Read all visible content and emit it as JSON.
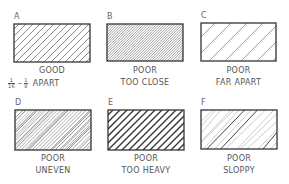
{
  "figure": {
    "panels": [
      {
        "id": "A",
        "letter": "A",
        "rating": "GOOD",
        "note": "APART",
        "fraction_low": {
          "num": "1",
          "den": "16"
        },
        "fraction_high": {
          "num": "1",
          "den": "8"
        },
        "dash": "–",
        "hatch": {
          "spacing": 7,
          "stroke": 0.7,
          "color": "#555555",
          "variant": "even"
        },
        "box": {
          "x": 14,
          "y": 24,
          "w": 76,
          "h": 38
        },
        "letter_pos": {
          "x": 14,
          "y": 13
        },
        "cap1_y": 66,
        "cap2_y": 78
      },
      {
        "id": "B",
        "letter": "B",
        "rating": "POOR",
        "note": "TOO CLOSE",
        "hatch": {
          "spacing": 2.6,
          "stroke": 0.6,
          "color": "#666666",
          "variant": "even"
        },
        "box": {
          "x": 107,
          "y": 24,
          "w": 76,
          "h": 37
        },
        "letter_pos": {
          "x": 107,
          "y": 13
        },
        "cap1_y": 66,
        "cap2_y": 78
      },
      {
        "id": "C",
        "letter": "C",
        "rating": "POOR",
        "note": "FAR APART",
        "hatch": {
          "spacing": 16,
          "stroke": 0.7,
          "color": "#777777",
          "variant": "even"
        },
        "box": {
          "x": 201,
          "y": 23,
          "w": 75,
          "h": 38
        },
        "letter_pos": {
          "x": 201,
          "y": 12
        },
        "cap1_y": 66,
        "cap2_y": 78
      },
      {
        "id": "D",
        "letter": "D",
        "rating": "POOR",
        "note": "UNEVEN",
        "hatch": {
          "spacing": 3,
          "stroke": 0.6,
          "color": "#666666",
          "variant": "uneven"
        },
        "box": {
          "x": 15,
          "y": 110,
          "w": 76,
          "h": 40
        },
        "letter_pos": {
          "x": 15,
          "y": 99
        },
        "cap1_y": 154,
        "cap2_y": 166
      },
      {
        "id": "E",
        "letter": "E",
        "rating": "POOR",
        "note": "TOO HEAVY",
        "hatch": {
          "spacing": 7,
          "stroke": 1.3,
          "color": "#333333",
          "variant": "even"
        },
        "box": {
          "x": 108,
          "y": 110,
          "w": 76,
          "h": 40
        },
        "letter_pos": {
          "x": 108,
          "y": 99
        },
        "cap1_y": 154,
        "cap2_y": 166
      },
      {
        "id": "F",
        "letter": "F",
        "rating": "POOR",
        "note": "SLOPPY",
        "hatch": {
          "spacing": 6,
          "stroke": 0.7,
          "color": "#999999",
          "variant": "sloppy"
        },
        "box": {
          "x": 201,
          "y": 110,
          "w": 76,
          "h": 39
        },
        "letter_pos": {
          "x": 201,
          "y": 99
        },
        "cap1_y": 154,
        "cap2_y": 166
      }
    ]
  },
  "colors": {
    "background": "#ffffff",
    "outline": "#333333",
    "text": "#555555"
  }
}
